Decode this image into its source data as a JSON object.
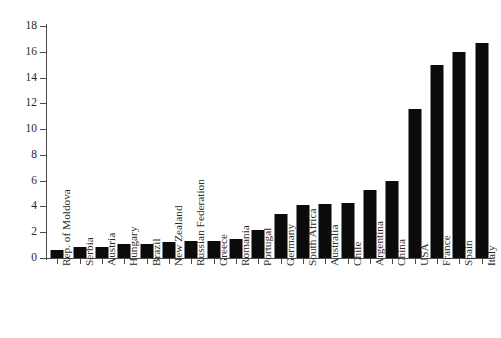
{
  "chart_data": {
    "type": "bar",
    "title": "",
    "subtitle": "",
    "xlabel": "",
    "ylabel": "",
    "ylim": [
      0,
      18
    ],
    "y_ticks": [
      0,
      2,
      4,
      6,
      8,
      10,
      12,
      14,
      16,
      18
    ],
    "grid": false,
    "legend": false,
    "bar_color": "#0b0b0b",
    "axis_color": "#4a4a4a",
    "background": "#ffffff",
    "categories": [
      "Rep. of Moldova",
      "Serbia",
      "Austria",
      "Hungary",
      "Brazil",
      "New Zealand",
      "Russian Federation",
      "Greece",
      "Romania",
      "Portugal",
      "Germany",
      "South Africa",
      "Australia",
      "Chile",
      "Argentina",
      "China",
      "USA",
      "France",
      "Spain",
      "Italy"
    ],
    "values": [
      0.65,
      0.85,
      0.85,
      1.05,
      1.1,
      1.25,
      1.3,
      1.3,
      1.5,
      2.2,
      3.4,
      4.1,
      4.2,
      4.3,
      5.3,
      6.0,
      11.6,
      15.0,
      16.0,
      16.7
    ]
  }
}
